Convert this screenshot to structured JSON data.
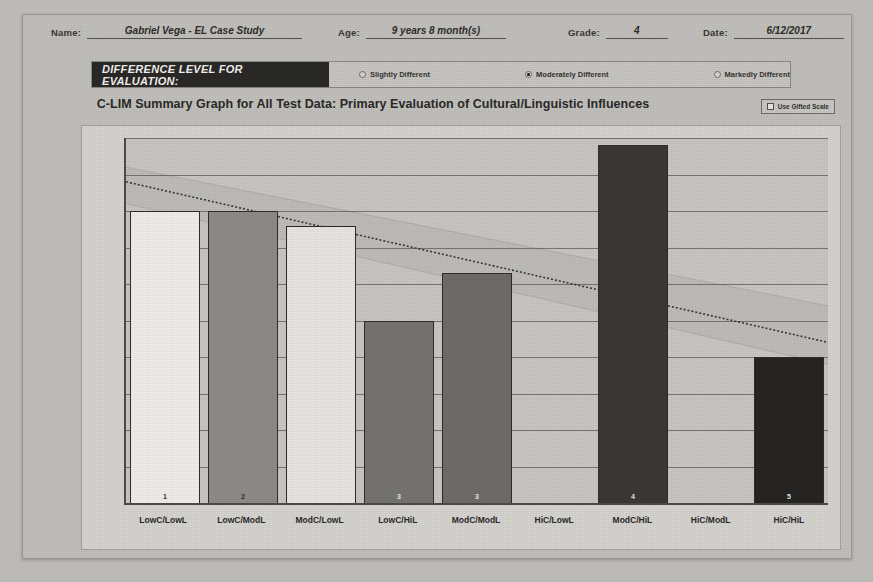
{
  "header": {
    "name_label": "Name:",
    "name_value": "Gabriel Vega - EL Case Study",
    "age_label": "Age:",
    "age_value": "9 years 8 month(s)",
    "grade_label": "Grade:",
    "grade_value": "4",
    "date_label": "Date:",
    "date_value": "6/12/2017"
  },
  "difference_level": {
    "tag": "DIFFERENCE LEVEL FOR EVALUATION:",
    "options": [
      {
        "label": "Slightly Different",
        "selected": false
      },
      {
        "label": "Moderately Different",
        "selected": true
      },
      {
        "label": "Markedly Different",
        "selected": false
      }
    ]
  },
  "gifted_scale": {
    "label": "Use Gifted Scale",
    "checked": false
  },
  "chart_data": {
    "type": "bar",
    "title": "C-LIM Summary Graph for All Test Data: Primary Evaluation of Cultural/Linguistic Influences",
    "xlabel": "",
    "ylabel": "",
    "ylim": [
      50,
      100
    ],
    "yticks": [
      50,
      55,
      60,
      65,
      70,
      75,
      80,
      85,
      90,
      95,
      100
    ],
    "grid": true,
    "legend": "none",
    "categories": [
      "LowC/LowL",
      "LowC/ModL",
      "ModC/LowL",
      "LowC/HiL",
      "ModC/ModL",
      "HiC/LowL",
      "ModC/HiL",
      "HiC/ModL",
      "HiC/HiL"
    ],
    "values": [
      90,
      90,
      88,
      75,
      81.5,
      null,
      99,
      null,
      70
    ],
    "point_labels": [
      "1",
      "2",
      "",
      "3",
      "3",
      "",
      "4",
      "",
      "5"
    ],
    "bar_colors": [
      "#f0eeeb",
      "#8e8c89",
      "#e8e6e3",
      "#767471",
      "#6f6d6a",
      null,
      "#3a3937",
      null,
      "#262523"
    ],
    "trend_line": {
      "style": "dotted",
      "start_value": 94,
      "end_value": 72
    },
    "expected_band": {
      "style": "shaded-diagonal",
      "upper_start": 96,
      "upper_end": 77,
      "lower_start": 91,
      "lower_end": 69
    }
  }
}
